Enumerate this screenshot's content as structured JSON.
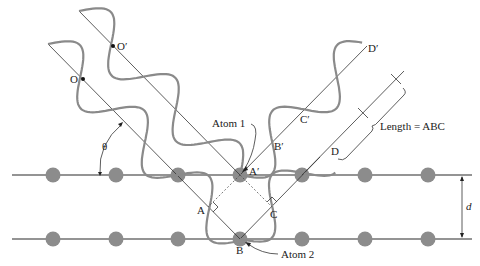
{
  "diagram": {
    "colors": {
      "atom": "#8c8c8c",
      "wave": "#8a8a8a",
      "line": "#333333"
    },
    "planes": [
      {
        "name": "plane-top",
        "y": 175,
        "x1": 12,
        "x2": 472
      },
      {
        "name": "plane-bottom",
        "y": 239,
        "x1": 12,
        "x2": 472
      }
    ],
    "atoms_x": [
      53,
      116,
      178,
      240,
      302,
      365,
      428
    ],
    "labels": {
      "O": "O",
      "O_prime": "O′",
      "atom1": "Atom 1",
      "atom2": "Atom 2",
      "A": "A",
      "A_prime": "A′",
      "B": "B",
      "B_prime": "B′",
      "C": "C",
      "C_prime": "C′",
      "D": "D",
      "D_prime": "D′",
      "theta": "θ",
      "d": "d",
      "length": "Length = ABC"
    }
  }
}
